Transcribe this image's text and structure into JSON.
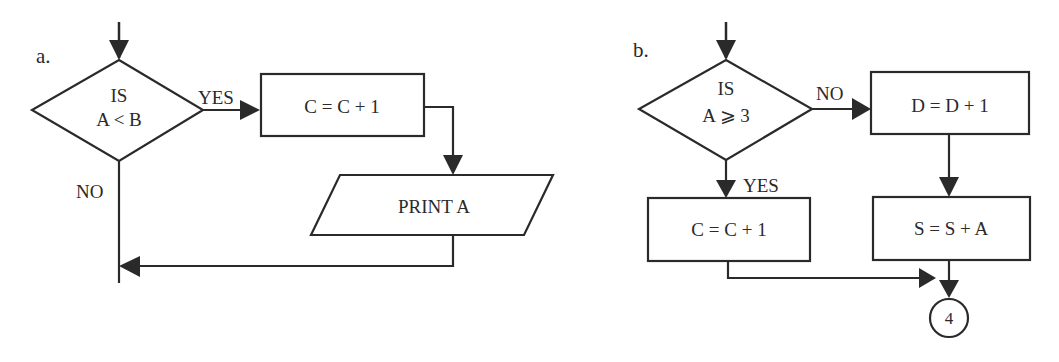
{
  "colors": {
    "stroke": "#2a2a2a",
    "background": "#ffffff"
  },
  "diagram_a": {
    "panel_label": "a.",
    "decision": {
      "line1": "IS",
      "line2": "A < B"
    },
    "yes_label": "YES",
    "no_label": "NO",
    "process": "C = C + 1",
    "output": "PRINT A"
  },
  "diagram_b": {
    "panel_label": "b.",
    "decision": {
      "line1": "IS",
      "line2": "A ⩾ 3"
    },
    "no_label": "NO",
    "yes_label": "YES",
    "process_no": "D = D + 1",
    "process_sum": "S = S + A",
    "process_yes": "C = C + 1",
    "connector": "4"
  }
}
